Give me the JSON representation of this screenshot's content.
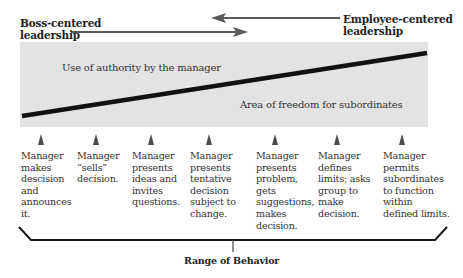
{
  "header": {
    "left_label": "Boss-centered\nleadership",
    "left_line1": "Boss-centered",
    "left_line2": "leadership",
    "right_line1": "Employee-centered",
    "right_line2": "leadership"
  },
  "band": {
    "upper_label": "Use of authority by the manager",
    "lower_label": "Area of freedom for subordinates"
  },
  "behaviors": [
    {
      "lines": [
        "Manager",
        "makes",
        "descision",
        "and",
        "announces",
        "it."
      ]
    },
    {
      "lines": [
        "Manager",
        "“sells”",
        "decision."
      ]
    },
    {
      "lines": [
        "Manager",
        "presents",
        "ideas and",
        "invites",
        "questions."
      ]
    },
    {
      "lines": [
        "Manager",
        "presents",
        "tentative",
        "decision",
        "subject to",
        "change."
      ]
    },
    {
      "lines": [
        "Manager",
        "presents",
        "problem,",
        "gets",
        "suggestions,",
        "makes",
        "decision."
      ]
    },
    {
      "lines": [
        "Manager",
        "defines",
        "limits; asks",
        "group to",
        "make",
        "decision."
      ]
    },
    {
      "lines": [
        "Manager",
        "permits",
        "subordinates",
        "to function",
        "within",
        "defined limits."
      ]
    }
  ],
  "footer": {
    "range_label": "Range of Behavior"
  },
  "colors": {
    "band": "#e3e3e3",
    "arrow": "#5a5a5a",
    "line": "#111111",
    "text": "#333333"
  }
}
